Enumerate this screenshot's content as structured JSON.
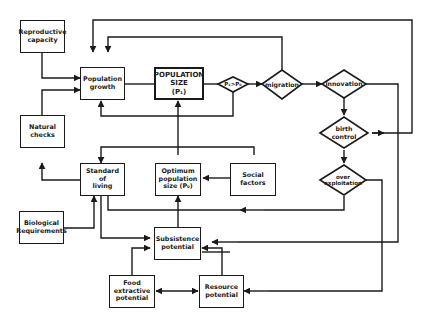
{
  "diagram": {
    "colors": {
      "stroke": "#1a1a1a",
      "background": "#ffffff"
    },
    "boxes": {
      "reproductive_capacity": "Reproductive\ncapacity",
      "population_growth": "Population\ngrowth",
      "population_size": "POPULATION\nSIZE\n(P₁)",
      "natural_checks": "Natural\nchecks",
      "standard_of_living": "Standard\nof\nliving",
      "optimum_population_size": "Optimum\npopulation\nsize (P₀)",
      "social_factors": "Social\nfactors",
      "biological_requirements": "Biological\nRequirements",
      "subsistence_potential": "Subsistence\npotential",
      "food_extractive_potential": "Food\nextractive\npotential",
      "resource_potential": "Resource\npotential"
    },
    "decisions": {
      "p1_gt_p0": "P₁>P₀",
      "migration": "migration",
      "innovation": "innovation",
      "birth_control": "birth\ncontrol",
      "over_exploitation": "over\nexploitation"
    }
  }
}
